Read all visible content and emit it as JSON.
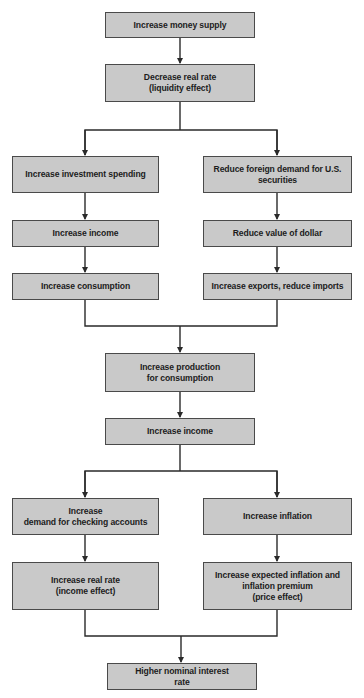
{
  "diagram": {
    "box_fill": "#c9c9c9",
    "line_color": "#2a2a2a",
    "nodes": {
      "n1": "Increase money supply",
      "n2": "Decrease real rate\n(liquidity effect)",
      "n3": "Increase investment spending",
      "n4": "Reduce foreign demand for U.S.\nsecurities",
      "n5": "Increase income",
      "n6": "Reduce value of dollar",
      "n7": "Increase consumption",
      "n8": "Increase exports, reduce imports",
      "n9": "Increase production\nfor consumption",
      "n10": "Increase income",
      "n11": "Increase\ndemand for checking accounts",
      "n12": "Increase inflation",
      "n13": "Increase real rate\n(income effect)",
      "n14": "Increase expected inflation and\ninflation premium\n(price effect)",
      "n15": "Higher nominal interest\nrate"
    }
  }
}
